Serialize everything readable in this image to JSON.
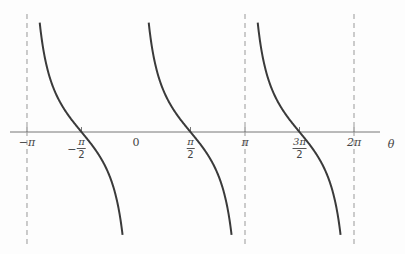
{
  "chart_data": {
    "type": "line",
    "title": "",
    "function": "cot(theta)",
    "xlabel": "θ",
    "ylabel": "",
    "x_range": [
      -3.1416,
      6.2832
    ],
    "ticks": [
      {
        "value": -3.1416,
        "label": "−π",
        "kind": "plain"
      },
      {
        "value": -1.5708,
        "label_num": "π",
        "label_den": "2",
        "sign": "−",
        "kind": "frac"
      },
      {
        "value": 0,
        "label": "0",
        "kind": "plain"
      },
      {
        "value": 1.5708,
        "label_num": "π",
        "label_den": "2",
        "sign": "",
        "kind": "frac"
      },
      {
        "value": 3.1416,
        "label": "π",
        "kind": "plain"
      },
      {
        "value": 4.7124,
        "label_num": "3π",
        "label_den": "2",
        "sign": "",
        "kind": "frac"
      },
      {
        "value": 6.2832,
        "label": "2π",
        "kind": "plain"
      }
    ],
    "asymptotes_dashed": [
      -3.1416,
      3.1416,
      6.2832
    ],
    "branches": [
      {
        "from": -3.1416,
        "to": 0,
        "zero_at": -1.5708
      },
      {
        "from": 0,
        "to": 3.1416,
        "zero_at": 1.5708
      },
      {
        "from": 3.1416,
        "to": 6.2832,
        "zero_at": 4.7124
      }
    ],
    "grid": false,
    "legend": null,
    "colors": {
      "curve": "#3a3a3a",
      "axis": "#777777",
      "asymptote": "#999999"
    }
  }
}
